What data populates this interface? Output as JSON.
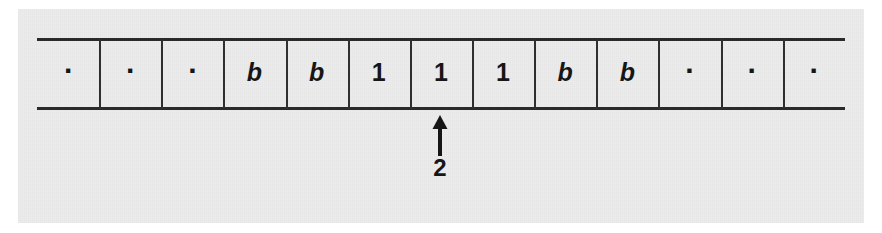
{
  "figure": {
    "kind": "turing-machine-tape-diagram",
    "background_color": "#ececed",
    "ink_color": "#161616",
    "rule_color": "#2a2a2a"
  },
  "tape": {
    "cell_count": 13,
    "cells": [
      {
        "index": 1,
        "symbol": ".",
        "type": "dot"
      },
      {
        "index": 2,
        "symbol": ".",
        "type": "dot"
      },
      {
        "index": 3,
        "symbol": ".",
        "type": "dot"
      },
      {
        "index": 4,
        "symbol": "b",
        "type": "letter"
      },
      {
        "index": 5,
        "symbol": "b",
        "type": "letter"
      },
      {
        "index": 6,
        "symbol": "1",
        "type": "digit"
      },
      {
        "index": 7,
        "symbol": "1",
        "type": "digit"
      },
      {
        "index": 8,
        "symbol": "1",
        "type": "digit"
      },
      {
        "index": 9,
        "symbol": "b",
        "type": "letter"
      },
      {
        "index": 10,
        "symbol": "b",
        "type": "letter"
      },
      {
        "index": 11,
        "symbol": ".",
        "type": "dot"
      },
      {
        "index": 12,
        "symbol": ".",
        "type": "dot"
      },
      {
        "index": 13,
        "symbol": ".",
        "type": "dot"
      }
    ]
  },
  "head": {
    "label": "2",
    "points_to_cell_index": 7,
    "arrow_direction": "up"
  }
}
